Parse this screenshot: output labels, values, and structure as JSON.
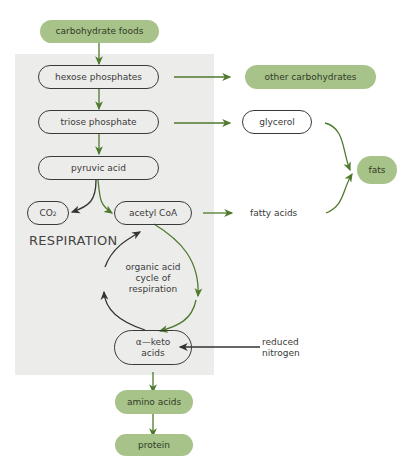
{
  "diagram": {
    "panel_label": "RESPIRATION",
    "nodes": {
      "carbohydrate_foods": "carbohydrate foods",
      "hexose_phosphates": "hexose phosphates",
      "other_carbohydrates": "other carbohydrates",
      "triose_phosphate": "triose phosphate",
      "glycerol": "glycerol",
      "fats": "fats",
      "pyruvic_acid": "pyruvic acid",
      "co2": "CO",
      "co2_sub": "2",
      "acetyl_coa": "acetyl CoA",
      "fatty_acids": "fatty acids",
      "cycle_line1": "organic acid",
      "cycle_line2": "cycle of",
      "cycle_line3": "respiration",
      "keto_line1": "α—keto",
      "keto_line2": "acids",
      "reduced_line1": "reduced",
      "reduced_line2": "nitrogen",
      "amino_acids": "amino acids",
      "protein": "protein"
    },
    "colors": {
      "green_fill": "#a8c38a",
      "green_arrow": "#4f7a2e",
      "dark_arrow": "#333333",
      "panel": "#ececea"
    }
  }
}
